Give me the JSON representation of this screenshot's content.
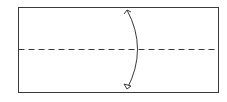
{
  "diagram": {
    "type": "origami-fold-step",
    "paper": {
      "x": 18,
      "y": 7,
      "width": 200,
      "height": 85,
      "stroke": "#3a3a3a"
    },
    "fold_line": {
      "style": "valley-dashed",
      "y": 49,
      "stroke": "#3a3a3a"
    },
    "arrow": {
      "direction": "bidirectional",
      "meaning": "fold and unfold",
      "stroke": "#3a3a3a"
    }
  }
}
